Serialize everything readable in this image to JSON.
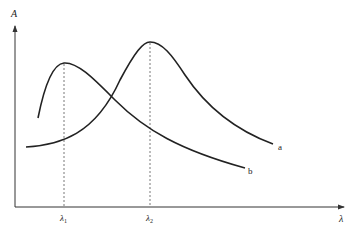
{
  "diagram": {
    "type": "absorption-spectra-comparison",
    "axes": {
      "y_label": "A",
      "x_label": "λ"
    },
    "curves": [
      {
        "id": "a",
        "label": "a",
        "peak_label": "λ",
        "peak_label_sub": "2",
        "path": "M26,147 C60,145 95,135 120,80 C135,52 143,42 150,42 C162,42 172,55 185,75 C205,105 235,130 273,144"
      },
      {
        "id": "b",
        "label": "b",
        "peak_label": "λ",
        "peak_label_sub": "1",
        "path": "M38,118 C44,88 52,64 64,63 C78,62 95,80 115,100 C145,130 180,150 245,168"
      }
    ],
    "colors": {
      "curve": "#222222",
      "axis": "#333333",
      "dashed": "#555555",
      "background": "#ffffff"
    }
  }
}
